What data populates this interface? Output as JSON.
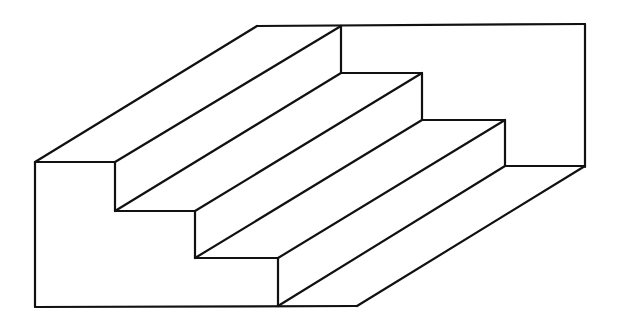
{
  "figure": {
    "stroke_color": "#111111",
    "background": "#ffffff"
  },
  "segments": [
    [
      257,
      26,
      585,
      24
    ],
    [
      585,
      24,
      585,
      167
    ],
    [
      35,
      162,
      115,
      162
    ],
    [
      35,
      162,
      35,
      307
    ],
    [
      35,
      307,
      357,
      306
    ],
    [
      115,
      162,
      115,
      211
    ],
    [
      115,
      211,
      195,
      211
    ],
    [
      195,
      211,
      195,
      258
    ],
    [
      195,
      258,
      278,
      258
    ],
    [
      278,
      258,
      278,
      306
    ],
    [
      341,
      26,
      341,
      73
    ],
    [
      341,
      73,
      422,
      73
    ],
    [
      422,
      73,
      422,
      120
    ],
    [
      422,
      120,
      505,
      120
    ],
    [
      505,
      120,
      505,
      166
    ],
    [
      505,
      166,
      585,
      166
    ],
    [
      35,
      162,
      257,
      26
    ],
    [
      115,
      162,
      341,
      26
    ],
    [
      115,
      211,
      341,
      73
    ],
    [
      195,
      211,
      422,
      73
    ],
    [
      195,
      258,
      422,
      120
    ],
    [
      278,
      258,
      505,
      120
    ],
    [
      278,
      306,
      505,
      166
    ],
    [
      357,
      306,
      585,
      166
    ]
  ]
}
